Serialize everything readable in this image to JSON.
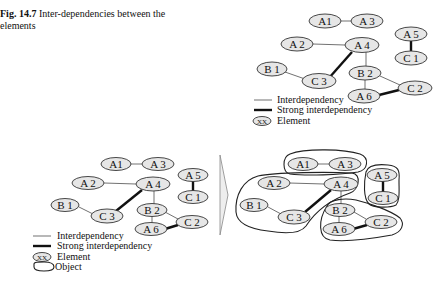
{
  "caption": {
    "figure_label": "Fig. 14.7",
    "title": "Inter-dependencies between the elements"
  },
  "colors": {
    "node_fill": "#e6e6e6",
    "node_stroke": "#333333",
    "line": "#222222",
    "object_stroke": "#222222",
    "arrow_fill": "#eeeeee"
  },
  "legend_top": {
    "interdependency": "Interdependency",
    "strong": "Strong interdependency",
    "element_symbol": "XX",
    "element": "Element"
  },
  "legend_bottom": {
    "interdependency": "Interdependency",
    "strong": "Strong interdependency",
    "element_symbol": "XX",
    "element": "Element",
    "object": "Object"
  },
  "nodes": {
    "A1": "A1",
    "A2": "A 2",
    "A3": "A 3",
    "A4": "A 4",
    "A5": "A 5",
    "A6": "A 6",
    "B1": "B 1",
    "B2": "B 2",
    "C1": "C 1",
    "C2": "C 2",
    "C3": "C 3"
  },
  "edges": [
    {
      "from": "A1",
      "to": "A3",
      "type": "interdependency"
    },
    {
      "from": "A2",
      "to": "A4",
      "type": "interdependency"
    },
    {
      "from": "A4",
      "to": "C3",
      "type": "strong"
    },
    {
      "from": "A4",
      "to": "B2",
      "type": "interdependency"
    },
    {
      "from": "B1",
      "to": "C3",
      "type": "interdependency"
    },
    {
      "from": "B2",
      "to": "A6",
      "type": "interdependency"
    },
    {
      "from": "B2",
      "to": "C2",
      "type": "interdependency"
    },
    {
      "from": "A6",
      "to": "C2",
      "type": "strong"
    },
    {
      "from": "A5",
      "to": "C1",
      "type": "strong"
    }
  ],
  "objects": [
    [
      "A1",
      "A3"
    ],
    [
      "A2",
      "A4",
      "B1",
      "C3"
    ],
    [
      "A5",
      "C1"
    ],
    [
      "B2",
      "A6",
      "C2"
    ]
  ]
}
